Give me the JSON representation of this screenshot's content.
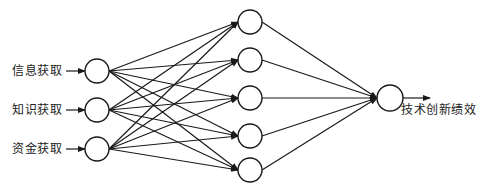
{
  "diagram": {
    "type": "neural-network",
    "stroke_color": "#1a1a1a",
    "node_fill": "#ffffff",
    "inputs": [
      {
        "label": "信息获取",
        "x": 97,
        "y": 71,
        "label_x": 12,
        "label_y": 64
      },
      {
        "label": "知识获取",
        "x": 97,
        "y": 110,
        "label_x": 12,
        "label_y": 103
      },
      {
        "label": "资金获取",
        "x": 97,
        "y": 149,
        "label_x": 12,
        "label_y": 142
      }
    ],
    "hidden": [
      {
        "x": 250,
        "y": 22
      },
      {
        "x": 250,
        "y": 60
      },
      {
        "x": 250,
        "y": 98
      },
      {
        "x": 250,
        "y": 136
      },
      {
        "x": 250,
        "y": 170
      }
    ],
    "output": {
      "label": "技术创新绩效",
      "x": 390,
      "y": 98,
      "label_x": 401,
      "label_y": 103,
      "arrow_end_x": 430
    },
    "node_radius": 12,
    "output_radius": 13
  }
}
